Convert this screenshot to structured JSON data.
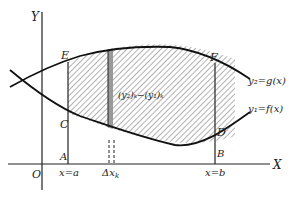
{
  "diagram": {
    "axes": {
      "y_label": "Y",
      "x_label": "X",
      "origin_label": "O"
    },
    "points": {
      "E": "E",
      "F": "F",
      "C": "C",
      "D": "D",
      "A": "A",
      "B": "B"
    },
    "curves": {
      "upper": "y₂=g(x)",
      "lower": "y₁=f(x)"
    },
    "bounds": {
      "left": "x=a",
      "right": "x=b"
    },
    "strip": {
      "width_label": "Δx",
      "width_sub": "k",
      "height_label": "(y₂)ₖ−(y₁)ₖ"
    },
    "colors": {
      "line": "#222222",
      "hatch": "#555555",
      "strip": "#888888",
      "background": "#ffffff"
    }
  }
}
